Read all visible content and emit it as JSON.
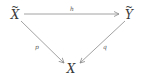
{
  "diagram": {
    "type": "commutative-diagram",
    "nodes": {
      "x_tilde": {
        "base": "X",
        "accent": "~",
        "pos": [
          15,
          14
        ]
      },
      "y_tilde": {
        "base": "Y",
        "accent": "~",
        "pos": [
          129,
          14
        ]
      },
      "x": {
        "base": "X",
        "accent": "",
        "pos": [
          71,
          69
        ]
      }
    },
    "edges": [
      {
        "from": "x_tilde",
        "to": "y_tilde",
        "label": "h"
      },
      {
        "from": "x_tilde",
        "to": "x",
        "label": "p"
      },
      {
        "from": "y_tilde",
        "to": "x",
        "label": "q"
      }
    ],
    "labels": {
      "h": "h",
      "p": "p",
      "q": "q"
    },
    "colors": {
      "stroke": "#8a8a8a",
      "text": "#3a3a3a"
    }
  }
}
